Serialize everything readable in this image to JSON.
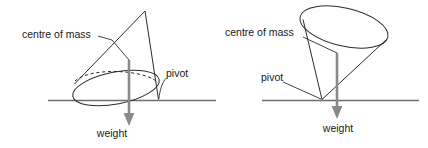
{
  "figure": {
    "background_color": "#ffffff",
    "outline_color": "#2b2b2b",
    "ground_color": "#6e6e6e",
    "arrow_color": "#8a8a8a",
    "text_color": "#1a1a1a"
  },
  "panels": [
    {
      "id": "left",
      "description": "Upright cone tilted, resting on its base rim, pivoting about the right edge of its base",
      "cone_orientation": "apex-up",
      "labels": {
        "centre_of_mass": "centre of mass",
        "pivot": "pivot",
        "weight": "weight"
      }
    },
    {
      "id": "right",
      "description": "Inverted cone balanced on its apex, pivoting about the apex touching the ground",
      "cone_orientation": "apex-down",
      "labels": {
        "centre_of_mass": "centre of mass",
        "pivot": "pivot",
        "weight": "weight"
      }
    }
  ]
}
